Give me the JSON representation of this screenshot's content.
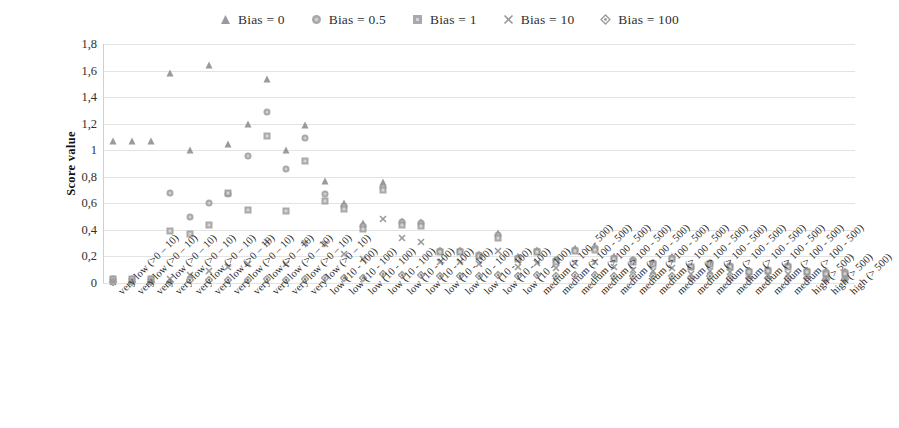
{
  "chart_data": {
    "type": "scatter",
    "title": "",
    "xlabel": "",
    "ylabel": "Score value",
    "ylim": [
      0,
      1.8
    ],
    "yticks": [
      0,
      0.2,
      0.4,
      0.6,
      0.8,
      1.0,
      1.2,
      1.4,
      1.6,
      1.8
    ],
    "ytick_labels": [
      "0",
      "0,2",
      "0,4",
      "0,6",
      "0,8",
      "1",
      "1,2",
      "1,4",
      "1,6",
      "1,8"
    ],
    "grid": "horizontal",
    "legend_position": "top-center",
    "marker_color": "#9a9a9a",
    "categories": [
      "very low (>0 – 10)",
      "very low (>0 – 10)",
      "very low (>0 – 10)",
      "very low (>0 – 10)",
      "very low (>0 – 10)",
      "very low (>0 – 10)",
      "very low (>0 – 10)",
      "very low (>0 – 10)",
      "very low (>0 – 10)",
      "very low (>0 – 10)",
      "very low (>0 – 10)",
      "low (10 - 100)",
      "low (10 - 100)",
      "low (10 - 100)",
      "low (10 - 100)",
      "low (10 - 100)",
      "low (10 - 100)",
      "low (10 - 100)",
      "low (10 - 100)",
      "low (10 - 100)",
      "low (10 - 100)",
      "low (10 - 100)",
      "medium (> 100 - 500)",
      "medium (> 100 - 500)",
      "medium (> 100 - 500)",
      "medium (> 100 - 500)",
      "medium (> 100 - 500)",
      "medium (> 100 - 500)",
      "medium (> 100 - 500)",
      "medium (> 100 - 500)",
      "medium (> 100 - 500)",
      "medium (> 100 - 500)",
      "medium (> 100 - 500)",
      "medium (> 100 - 500)",
      "medium (> 100 - 500)",
      "medium (> 100 - 500)",
      "high (> 500)",
      "high (> 500)",
      "high (> 500)"
    ],
    "series": [
      {
        "name": "Bias = 0",
        "marker": "triangle",
        "values": [
          1.07,
          1.07,
          1.07,
          1.58,
          1.0,
          1.64,
          1.05,
          1.2,
          1.54,
          1.0,
          1.19,
          0.77,
          0.6,
          0.45,
          0.76,
          0.47,
          0.46,
          0.25,
          0.25,
          0.22,
          0.38,
          0.2,
          0.25,
          0.18,
          0.26,
          0.27,
          0.2,
          0.18,
          0.16,
          0.2,
          0.13,
          0.16,
          0.14,
          0.1,
          0.11,
          0.14,
          0.1,
          0.09,
          0.09
        ]
      },
      {
        "name": "Bias = 0.5",
        "marker": "circle",
        "values": [
          0.03,
          0.03,
          0.03,
          0.68,
          0.5,
          0.6,
          0.67,
          0.96,
          1.29,
          0.86,
          1.09,
          0.67,
          0.58,
          0.43,
          0.72,
          0.46,
          0.45,
          0.24,
          0.24,
          0.21,
          0.36,
          0.19,
          0.24,
          0.17,
          0.25,
          0.26,
          0.19,
          0.17,
          0.15,
          0.19,
          0.12,
          0.15,
          0.13,
          0.09,
          0.1,
          0.13,
          0.09,
          0.08,
          0.08
        ]
      },
      {
        "name": "Bias = 1",
        "marker": "square",
        "values": [
          0.03,
          0.03,
          0.03,
          0.39,
          0.37,
          0.44,
          0.68,
          0.55,
          1.11,
          0.54,
          0.92,
          0.62,
          0.56,
          0.41,
          0.7,
          0.44,
          0.43,
          0.23,
          0.23,
          0.2,
          0.34,
          0.18,
          0.23,
          0.16,
          0.24,
          0.25,
          0.18,
          0.16,
          0.14,
          0.18,
          0.12,
          0.14,
          0.12,
          0.08,
          0.09,
          0.12,
          0.08,
          0.07,
          0.07
        ]
      },
      {
        "name": "Bias = 10",
        "marker": "cross",
        "values": [
          0.01,
          0.01,
          0.01,
          0.03,
          0.06,
          0.09,
          0.12,
          0.14,
          0.31,
          0.14,
          0.3,
          0.29,
          0.22,
          0.18,
          0.48,
          0.34,
          0.31,
          0.16,
          0.16,
          0.14,
          0.24,
          0.12,
          0.15,
          0.11,
          0.15,
          0.16,
          0.12,
          0.1,
          0.09,
          0.11,
          0.07,
          0.09,
          0.08,
          0.05,
          0.06,
          0.07,
          0.05,
          0.04,
          0.04
        ]
      },
      {
        "name": "Bias = 100",
        "marker": "diamond",
        "values": [
          0.01,
          0.01,
          0.01,
          0.01,
          0.02,
          0.02,
          0.02,
          0.02,
          0.03,
          0.02,
          0.03,
          0.04,
          0.04,
          0.04,
          0.07,
          0.06,
          0.06,
          0.05,
          0.05,
          0.05,
          0.06,
          0.05,
          0.06,
          0.05,
          0.06,
          0.06,
          0.05,
          0.05,
          0.05,
          0.05,
          0.04,
          0.05,
          0.04,
          0.04,
          0.04,
          0.04,
          0.04,
          0.03,
          0.03
        ]
      }
    ]
  }
}
